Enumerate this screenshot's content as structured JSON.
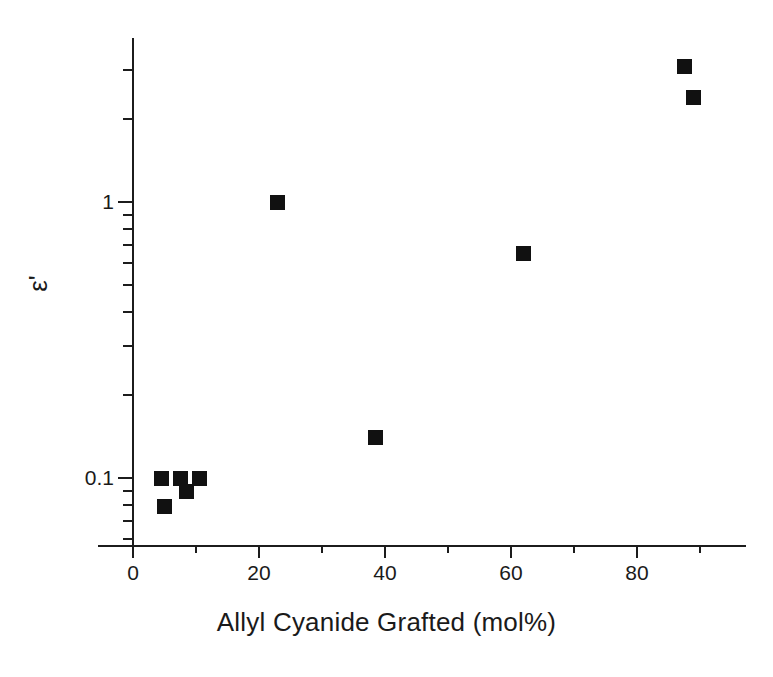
{
  "chart_data": {
    "type": "scatter",
    "title": "",
    "xlabel": "Allyl Cyanide Grafted (mol%)",
    "ylabel": "ε'",
    "yscale": "log",
    "xscale": "linear",
    "xlim": [
      -5,
      97
    ],
    "ylim": [
      0.05,
      4.2
    ],
    "grid": false,
    "legend": null,
    "xticks": [
      0,
      20,
      40,
      60,
      80
    ],
    "xtick_labels": [
      "0",
      "20",
      "40",
      "60",
      "80"
    ],
    "xminorticks": [
      10,
      30,
      50,
      70,
      90
    ],
    "yticks": [
      0.1,
      1
    ],
    "ytick_labels": [
      "0.1",
      "1"
    ],
    "yminorticks": [
      0.06,
      0.07,
      0.08,
      0.09,
      0.2,
      0.3,
      0.4,
      0.5,
      0.6,
      0.7,
      0.8,
      0.9,
      2,
      3,
      4
    ],
    "marker": "square",
    "marker_color": "#111111",
    "x": [
      4.5,
      5.0,
      7.5,
      8.5,
      10.5,
      23.0,
      38.5,
      62.0,
      87.5,
      89.0
    ],
    "y": [
      0.1,
      0.079,
      0.1,
      0.089,
      0.1,
      1.0,
      0.14,
      0.65,
      3.1,
      2.4
    ],
    "points": [
      {
        "x": 4.5,
        "y": 0.1
      },
      {
        "x": 5.0,
        "y": 0.079
      },
      {
        "x": 7.5,
        "y": 0.1
      },
      {
        "x": 8.5,
        "y": 0.089
      },
      {
        "x": 10.5,
        "y": 0.1
      },
      {
        "x": 23.0,
        "y": 1.0
      },
      {
        "x": 38.5,
        "y": 0.14
      },
      {
        "x": 62.0,
        "y": 0.65
      },
      {
        "x": 87.5,
        "y": 3.1
      },
      {
        "x": 89.0,
        "y": 2.4
      }
    ]
  },
  "axes": {
    "x_title": "Allyl Cyanide Grafted (mol%)",
    "y_title": "ε'",
    "x_tick_labels": [
      "0",
      "20",
      "40",
      "60",
      "80"
    ],
    "y_tick_labels": [
      "0.1",
      "1"
    ]
  },
  "colors": {
    "axis": "#1c1c1c",
    "marker": "#111111",
    "background": "#ffffff",
    "text": "#1a1a1a"
  }
}
